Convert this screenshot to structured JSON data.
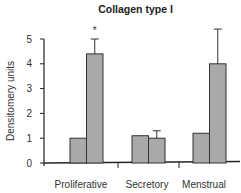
{
  "chart_data": {
    "type": "bar",
    "title": "Collagen type I",
    "xlabel": "",
    "ylabel": "Densitomery units",
    "ylim": [
      0,
      5
    ],
    "yticks": [
      0,
      1,
      2,
      3,
      4,
      5
    ],
    "categories": [
      "Proliferative",
      "Secretory",
      "Menstrual"
    ],
    "series": [
      {
        "name": "Series 1",
        "values": [
          1.0,
          1.1,
          1.2
        ],
        "errors": [
          null,
          null,
          null
        ],
        "color": "#a9a9a9"
      },
      {
        "name": "Series 2",
        "values": [
          4.4,
          1.0,
          4.0
        ],
        "errors": [
          0.6,
          0.3,
          1.4
        ],
        "color": "#a9a9a9"
      }
    ],
    "annotations": [
      {
        "text": "*",
        "category": "Proliferative",
        "series": "Series 2"
      }
    ],
    "grid": false,
    "legend": "none"
  }
}
